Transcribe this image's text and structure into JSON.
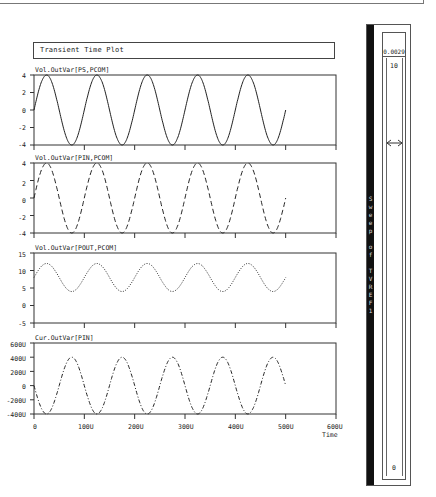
{
  "window": {
    "title": "Transient Time Plot"
  },
  "plots": [
    {
      "label": "Vol.OutVar[PS,PCOM]",
      "yticks": [
        "4",
        "2",
        "0",
        "-2",
        "-4"
      ],
      "style": "solid"
    },
    {
      "label": "Vol.OutVar[PIN,PCOM]",
      "yticks": [
        "4",
        "2",
        "0",
        "-2",
        "-4"
      ],
      "style": "dashed"
    },
    {
      "label": "Vol.OutVar[POUT,PCOM]",
      "yticks": [
        "15",
        "10",
        "5",
        "0",
        "-5"
      ],
      "style": "dotted"
    },
    {
      "label": "Cur.OutVar[PIN]",
      "yticks": [
        "600U",
        "400U",
        "200U",
        "0",
        "-200U",
        "-400U"
      ],
      "style": "dashdot"
    }
  ],
  "xaxis": {
    "ticks": [
      "0",
      "100U",
      "200U",
      "300U",
      "400U",
      "500U",
      "600U"
    ],
    "label": "Time"
  },
  "sweep_panel": {
    "title": "Sweep of TVREF1",
    "title_chars": [
      "S",
      "w",
      "e",
      "e",
      "p",
      "",
      "o",
      "f",
      "",
      "T",
      "V",
      "R",
      "E",
      "F",
      "1"
    ],
    "value": "0.0029",
    "max": "10",
    "min": "0"
  },
  "chart_data": [
    {
      "type": "line",
      "title": "Transient Time Plot",
      "ylabel": "Vol.OutVar[PS,PCOM]",
      "xlabel": "Time",
      "x_ticks": [
        "0",
        "100U",
        "200U",
        "300U",
        "400U",
        "500U",
        "600U"
      ],
      "y_ticks": [
        4,
        2,
        0,
        -2,
        -4
      ],
      "ylim": [
        -4,
        4
      ],
      "xlim": [
        0,
        600
      ],
      "series": [
        {
          "name": "PS,PCOM",
          "shape": "sine",
          "amplitude": 4,
          "offset": 0,
          "period_us": 100,
          "x_range_us": [
            0,
            500
          ],
          "line": "solid"
        }
      ]
    },
    {
      "type": "line",
      "ylabel": "Vol.OutVar[PIN,PCOM]",
      "y_ticks": [
        4,
        2,
        0,
        -2,
        -4
      ],
      "ylim": [
        -4,
        4
      ],
      "xlim": [
        0,
        600
      ],
      "series": [
        {
          "name": "PIN,PCOM",
          "shape": "sine",
          "amplitude": 4,
          "offset": 0,
          "period_us": 100,
          "x_range_us": [
            0,
            500
          ],
          "line": "dashed"
        }
      ]
    },
    {
      "type": "line",
      "ylabel": "Vol.OutVar[POUT,PCOM]",
      "y_ticks": [
        15,
        10,
        5,
        0,
        -5
      ],
      "ylim": [
        -5,
        15
      ],
      "xlim": [
        0,
        600
      ],
      "series": [
        {
          "name": "POUT,PCOM",
          "shape": "sine",
          "amplitude": 4,
          "offset": 8,
          "period_us": 100,
          "x_range_us": [
            0,
            500
          ],
          "line": "dotted"
        }
      ]
    },
    {
      "type": "line",
      "ylabel": "Cur.OutVar[PIN]",
      "y_ticks": [
        "600U",
        "400U",
        "200U",
        "0",
        "-200U",
        "-400U"
      ],
      "ylim": [
        -400,
        600
      ],
      "xlim": [
        0,
        600
      ],
      "series": [
        {
          "name": "PIN",
          "shape": "sine",
          "amplitude": 400,
          "offset": 0,
          "period_us": 100,
          "phase": "starts at 0, descending",
          "x_range_us": [
            0,
            500
          ],
          "line": "dashdot"
        }
      ]
    }
  ]
}
